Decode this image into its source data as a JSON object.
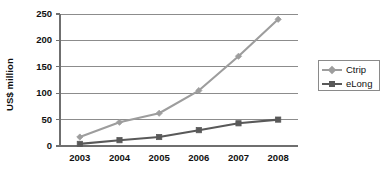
{
  "chart_data": {
    "type": "line",
    "title": "",
    "xlabel": "",
    "ylabel": "US$ million",
    "categories": [
      "2003",
      "2004",
      "2005",
      "2006",
      "2007",
      "2008"
    ],
    "x": [
      2003,
      2004,
      2005,
      2006,
      2007,
      2008
    ],
    "ylim": [
      0,
      250
    ],
    "yticks": [
      0,
      50,
      100,
      150,
      200,
      250
    ],
    "ytick_labels": [
      "0",
      "50",
      "100",
      "150",
      "200",
      "250"
    ],
    "grid": "horizontal",
    "legend_position": "right",
    "series": [
      {
        "name": "Ctrip",
        "color": "#9d9d9d",
        "marker": "diamond",
        "values": [
          17,
          45,
          62,
          105,
          170,
          240
        ]
      },
      {
        "name": "eLong",
        "color": "#595959",
        "marker": "square",
        "values": [
          4,
          11,
          17,
          30,
          43,
          50
        ]
      }
    ]
  },
  "legend": {
    "items": [
      {
        "label": "Ctrip"
      },
      {
        "label": "eLong"
      }
    ]
  },
  "colors": {
    "background": "#ffffff",
    "axis": "#6f6f6f",
    "grid": "#8c8c8c",
    "text": "#111111",
    "series_ctrip": "#9d9d9d",
    "series_elong": "#595959"
  }
}
